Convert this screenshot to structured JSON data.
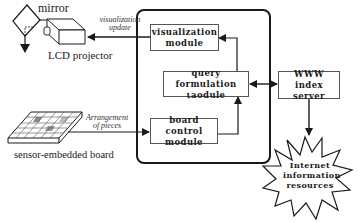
{
  "diagram": {
    "devices": {
      "mirror_label": "mirror",
      "projector_label": "LCD projector",
      "board_label": "sensor-embedded board"
    },
    "edge_labels": {
      "visualization_update": [
        "visualization",
        "update"
      ],
      "arrangement_of_pieces": [
        "Arrangement",
        "of pieces"
      ]
    },
    "modules": {
      "visualization": [
        "visualization",
        "module"
      ],
      "query_formulation": [
        "query formulation",
        "ιaodule"
      ],
      "board_control": [
        "board control",
        "module"
      ],
      "www_index_server": [
        "WWW index",
        "server"
      ]
    },
    "cloud": {
      "label": [
        "Internet",
        "information",
        "resources"
      ]
    },
    "colors": {
      "stroke": "#1a1a1a",
      "box_border": "#555555",
      "board_highlight": "#9a9a9a"
    }
  }
}
